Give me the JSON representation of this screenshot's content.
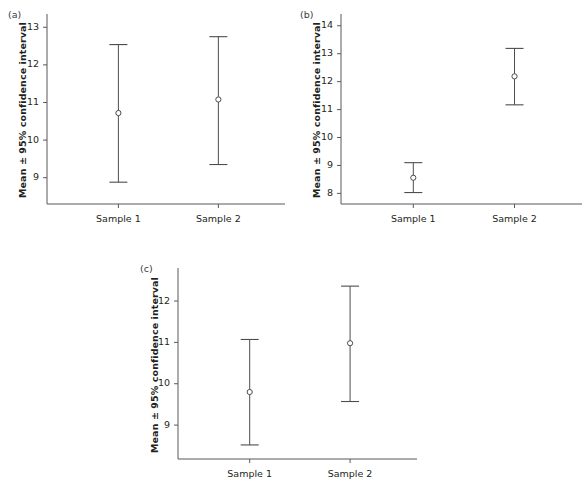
{
  "figure": {
    "background": "#ffffff",
    "line_color": "#58595b",
    "text_color": "#231f20",
    "panel_count": 3
  },
  "chart_data": [
    {
      "type": "scatter",
      "panel_tag": "(a)",
      "title": "",
      "xlabel": "",
      "ylabel": "Mean ± 95% confidence interval",
      "categories": [
        "Sample 1",
        "Sample 2"
      ],
      "yticks": [
        9,
        10,
        11,
        12,
        13
      ],
      "ytick_labels": [
        "9",
        "10",
        "11",
        "12",
        "13"
      ],
      "ylim": [
        8.3,
        13.3
      ],
      "grid": false,
      "legend": "none",
      "error_style": "mean with 95% confidence interval caps",
      "series": [
        {
          "name": "Mean ± 95% CI",
          "means": [
            10.72,
            11.08
          ],
          "ci_lower": [
            8.88,
            9.35
          ],
          "ci_upper": [
            12.54,
            12.75
          ]
        }
      ]
    },
    {
      "type": "scatter",
      "panel_tag": "(b)",
      "title": "",
      "xlabel": "",
      "ylabel": "Mean ± 95% confidence interval",
      "categories": [
        "Sample 1",
        "Sample 2"
      ],
      "yticks": [
        8,
        9,
        10,
        11,
        12,
        13,
        14
      ],
      "ytick_labels": [
        "8",
        "9",
        "10",
        "11",
        "12",
        "13",
        "14"
      ],
      "ylim": [
        7.62,
        14.35
      ],
      "grid": false,
      "legend": "none",
      "error_style": "mean with 95% confidence interval caps",
      "series": [
        {
          "name": "Mean ± 95% CI",
          "means": [
            8.56,
            12.19
          ],
          "ci_lower": [
            8.03,
            11.17
          ],
          "ci_upper": [
            9.1,
            13.19
          ]
        }
      ]
    },
    {
      "type": "scatter",
      "panel_tag": "(c)",
      "title": "",
      "xlabel": "",
      "ylabel": "Mean ± 95% confidence interval",
      "categories": [
        "Sample 1",
        "Sample 2"
      ],
      "yticks": [
        9,
        10,
        11,
        12
      ],
      "ytick_labels": [
        "9",
        "10",
        "11",
        "12"
      ],
      "ylim": [
        8.18,
        12.75
      ],
      "grid": false,
      "legend": "none",
      "error_style": "mean with 95% confidence interval caps",
      "series": [
        {
          "name": "Mean ± 95% CI",
          "means": [
            9.8,
            10.98
          ],
          "ci_lower": [
            8.52,
            9.57
          ],
          "ci_upper": [
            11.07,
            12.36
          ]
        }
      ]
    }
  ]
}
